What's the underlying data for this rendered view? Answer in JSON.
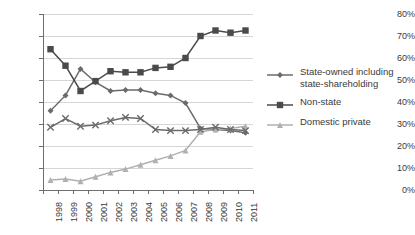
{
  "chart_data": {
    "type": "line",
    "title": "",
    "xlabel": "",
    "ylabel": "",
    "ylim": [
      0,
      80
    ],
    "ytick_labels": [
      "0%",
      "10%",
      "20%",
      "30%",
      "40%",
      "50%",
      "60%",
      "70%",
      "80%"
    ],
    "ytick_values": [
      0,
      10,
      20,
      30,
      40,
      50,
      60,
      70,
      80
    ],
    "grid": true,
    "legend_position": "right",
    "categories": [
      "1998",
      "1999",
      "2000",
      "2001",
      "2002",
      "2003",
      "2004",
      "2005",
      "2006",
      "2007",
      "2008",
      "2009",
      "2010",
      "2011"
    ],
    "series": [
      {
        "name": "State-owned including state-shareholding",
        "marker": "diamond",
        "color": "#6b6b6b",
        "values": [
          36,
          43,
          55,
          49,
          45,
          45.5,
          45.5,
          44,
          43,
          39.5,
          28,
          27.5,
          27,
          26
        ]
      },
      {
        "name": "Non-state",
        "marker": "square",
        "color": "#4a4a4a",
        "values": [
          64,
          56.5,
          45,
          49.5,
          54,
          53.5,
          53.5,
          55.5,
          56,
          60,
          70,
          72.5,
          71.5,
          72.5
        ]
      },
      {
        "name": "Domestic private",
        "marker": "triangle",
        "color": "#b0b0b0",
        "values": [
          4.5,
          5,
          4,
          6,
          8,
          9.5,
          11.5,
          13.5,
          15.5,
          18,
          26.5,
          27.5,
          28,
          29
        ]
      },
      {
        "name": "",
        "marker": "x",
        "color": "#6b6b6b",
        "legend_hidden": true,
        "values": [
          28.5,
          32.5,
          29,
          29.5,
          31.5,
          33,
          32.5,
          27.5,
          27,
          27,
          27.5,
          28.5,
          27.5,
          27
        ]
      }
    ]
  },
  "legend": {
    "items": [
      {
        "label": "State-owned including state-shareholding",
        "marker": "diamond",
        "color": "#6b6b6b"
      },
      {
        "label": "Non-state",
        "marker": "square",
        "color": "#4a4a4a"
      },
      {
        "label": "Domestic private",
        "marker": "triangle",
        "color": "#b0b0b0"
      }
    ]
  }
}
